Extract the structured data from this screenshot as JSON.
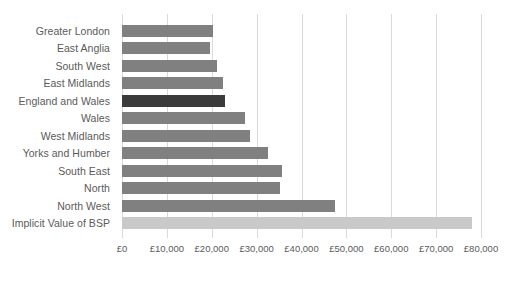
{
  "chart_data": {
    "type": "bar",
    "orientation": "horizontal",
    "title": "",
    "subtitle": "",
    "xlabel": "",
    "ylabel": "",
    "xlim": [
      0,
      80000
    ],
    "ylim": null,
    "grid": true,
    "legend": false,
    "legend_position": "none",
    "currency_prefix": "£",
    "tick_labels": [
      "£0",
      "£10,000",
      "£20,000",
      "£30,000",
      "£40,000",
      "£50,000",
      "£60,000",
      "£70,000",
      "£80,000"
    ],
    "tick_values": [
      0,
      10000,
      20000,
      30000,
      40000,
      50000,
      60000,
      70000,
      80000
    ],
    "categories": [
      "Greater London",
      "East Anglia",
      "South West",
      "East Midlands",
      "England and Wales",
      "Wales",
      "West Midlands",
      "Yorks and Humber",
      "South East",
      "North",
      "North West",
      "Implicit Value of BSP"
    ],
    "values": [
      20200,
      19700,
      21100,
      22600,
      22900,
      27400,
      28500,
      32500,
      35600,
      35300,
      47400,
      78000
    ],
    "bar_styles": [
      "normal",
      "normal",
      "normal",
      "normal",
      "highlight",
      "normal",
      "normal",
      "normal",
      "normal",
      "normal",
      "normal",
      "total"
    ],
    "colors": {
      "bar_normal": "#808080",
      "bar_highlight": "#3b3b3b",
      "bar_total": "#c9c9c9",
      "gridline": "#d9d9d9",
      "text": "#5a5a5a",
      "background": "#ffffff"
    }
  }
}
